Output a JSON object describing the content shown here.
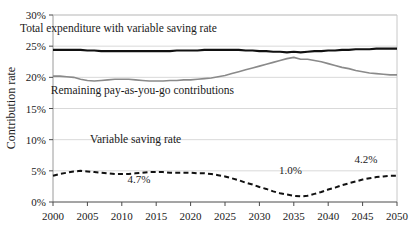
{
  "chart_data": {
    "type": "line",
    "title": "",
    "xlabel": "",
    "ylabel": "Contribution rate",
    "xlim": [
      2000,
      2050
    ],
    "ylim": [
      0,
      30
    ],
    "grid": true,
    "legend_position": "inline-labels",
    "x_ticks": [
      "2000",
      "2005",
      "2010",
      "2015",
      "2020",
      "2025",
      "2030",
      "2035",
      "2040",
      "2045",
      "2050"
    ],
    "y_ticks": [
      "0%",
      "5%",
      "10%",
      "15%",
      "20%",
      "25%",
      "30%"
    ],
    "x": [
      2000,
      2001,
      2002,
      2003,
      2004,
      2005,
      2006,
      2007,
      2008,
      2009,
      2010,
      2011,
      2012,
      2013,
      2014,
      2015,
      2016,
      2017,
      2018,
      2019,
      2020,
      2021,
      2022,
      2023,
      2024,
      2025,
      2026,
      2027,
      2028,
      2029,
      2030,
      2031,
      2032,
      2033,
      2034,
      2035,
      2036,
      2037,
      2038,
      2039,
      2040,
      2041,
      2042,
      2043,
      2044,
      2045,
      2046,
      2047,
      2048,
      2049,
      2050
    ],
    "series": [
      {
        "name": "Total expenditure with variable saving rate",
        "color": "#111111",
        "style": "solid",
        "width": 2.1,
        "values": [
          24.4,
          24.4,
          24.4,
          24.4,
          24.4,
          24.3,
          24.3,
          24.2,
          24.2,
          24.2,
          24.2,
          24.2,
          24.2,
          24.2,
          24.2,
          24.2,
          24.2,
          24.2,
          24.3,
          24.3,
          24.3,
          24.3,
          24.4,
          24.4,
          24.4,
          24.4,
          24.4,
          24.4,
          24.3,
          24.3,
          24.2,
          24.2,
          24.1,
          24.1,
          24.0,
          24.1,
          24.0,
          24.1,
          24.2,
          24.2,
          24.3,
          24.3,
          24.4,
          24.4,
          24.5,
          24.5,
          24.5,
          24.6,
          24.6,
          24.6,
          24.6
        ]
      },
      {
        "name": "Remaining pay-as-you-go contributions",
        "color": "#8a8a8a",
        "style": "solid",
        "width": 1.6,
        "values": [
          20.2,
          20.2,
          20.1,
          20.0,
          19.7,
          19.5,
          19.4,
          19.5,
          19.6,
          19.7,
          19.7,
          19.7,
          19.6,
          19.5,
          19.4,
          19.4,
          19.4,
          19.5,
          19.5,
          19.6,
          19.6,
          19.7,
          19.8,
          19.9,
          20.1,
          20.3,
          20.6,
          20.9,
          21.2,
          21.5,
          21.8,
          22.1,
          22.4,
          22.7,
          23.0,
          23.2,
          22.9,
          22.9,
          22.7,
          22.5,
          22.2,
          21.9,
          21.6,
          21.4,
          21.1,
          20.9,
          20.7,
          20.6,
          20.5,
          20.4,
          20.4
        ]
      },
      {
        "name": "Variable saving rate",
        "color": "#111111",
        "style": "dashed",
        "width": 2.0,
        "values": [
          4.2,
          4.5,
          4.7,
          4.9,
          5.0,
          4.9,
          4.8,
          4.7,
          4.6,
          4.5,
          4.5,
          4.5,
          4.6,
          4.7,
          4.8,
          4.8,
          4.8,
          4.7,
          4.7,
          4.7,
          4.7,
          4.6,
          4.6,
          4.5,
          4.3,
          4.1,
          3.8,
          3.5,
          3.1,
          2.8,
          2.4,
          2.1,
          1.7,
          1.4,
          1.2,
          1.0,
          0.9,
          1.0,
          1.3,
          1.6,
          2.0,
          2.3,
          2.7,
          3.0,
          3.3,
          3.6,
          3.8,
          4.0,
          4.1,
          4.2,
          4.2
        ]
      }
    ],
    "annotations": [
      {
        "text": "4.7%",
        "x": 2012.5,
        "y": 3.0,
        "name": "annotation-4-7-percent"
      },
      {
        "text": "1.0%",
        "x": 2034.5,
        "y": 4.5,
        "name": "annotation-1-0-percent"
      },
      {
        "text": "4.2%",
        "x": 2045.5,
        "y": 6.3,
        "name": "annotation-4-2-percent"
      }
    ],
    "series_labels": [
      {
        "text": "Total expenditure with variable saving rate",
        "x": 2009.5,
        "y": 27.3,
        "name": "series-label-total-expenditure"
      },
      {
        "text": "Remaining pay-as-you-go contributions",
        "x": 2013.0,
        "y": 17.3,
        "name": "series-label-payg-contributions"
      },
      {
        "text": "Variable saving rate",
        "x": 2012.0,
        "y": 9.5,
        "name": "series-label-variable-saving-rate"
      }
    ]
  }
}
